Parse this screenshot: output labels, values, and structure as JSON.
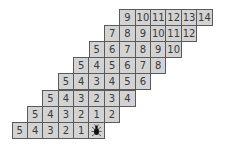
{
  "grid": {
    "cell_color": "#d3d3d3",
    "border_color": "#5a5a5a",
    "rows": [
      {
        "offset": 7,
        "cells": [
          "9",
          "10",
          "11",
          "12",
          "13",
          "14"
        ]
      },
      {
        "offset": 6,
        "cells": [
          "7",
          "8",
          "9",
          "10",
          "11",
          "12"
        ]
      },
      {
        "offset": 5,
        "cells": [
          "5",
          "6",
          "7",
          "8",
          "9",
          "10"
        ]
      },
      {
        "offset": 4,
        "cells": [
          "5",
          "4",
          "5",
          "6",
          "7",
          "8"
        ]
      },
      {
        "offset": 3,
        "cells": [
          "5",
          "4",
          "3",
          "4",
          "5",
          "6"
        ]
      },
      {
        "offset": 2,
        "cells": [
          "5",
          "4",
          "3",
          "2",
          "3",
          "4"
        ]
      },
      {
        "offset": 1,
        "cells": [
          "5",
          "4",
          "3",
          "2",
          "1",
          "2"
        ]
      },
      {
        "offset": 0,
        "cells": [
          "5",
          "4",
          "3",
          "2",
          "1",
          "bug-icon"
        ]
      }
    ]
  }
}
